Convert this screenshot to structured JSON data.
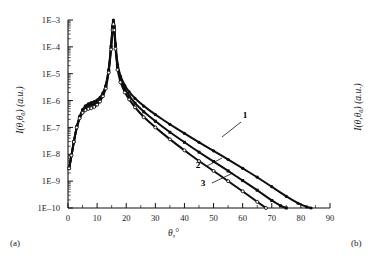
{
  "figure": {
    "panel_a_tag": "(a)",
    "panel_b_tag": "(b)"
  },
  "chart_data": {
    "type": "line",
    "title": "",
    "xlabel": "θ,°",
    "ylabel": "I(θ,θ₀) (a.u.)",
    "xlabel_italic": "θ",
    "xlabel_rest": ",°",
    "yscale": "log",
    "xscale": "linear",
    "xlim": [
      0,
      90
    ],
    "ylim": [
      1e-10,
      0.001
    ],
    "grid": false,
    "legend_position": "inline-annotations",
    "xticks": [
      0,
      10,
      20,
      30,
      40,
      50,
      60,
      70,
      80,
      90
    ],
    "xticklabels": [
      "0",
      "10",
      "20",
      "30",
      "40",
      "50",
      "60",
      "70",
      "80",
      "90"
    ],
    "yticks": [
      0.001,
      0.0001,
      1e-05,
      1e-06,
      1e-07,
      1e-08,
      1e-09,
      1e-10
    ],
    "yticklabels": [
      "1E–3",
      "1E–4",
      "1E–5",
      "1E–6",
      "1E–7",
      "1E–8",
      "1E–9",
      "1E–10"
    ],
    "annotations": [
      {
        "text": "1",
        "x": 46.0,
        "y": 4e-07
      },
      {
        "text": "2",
        "x": 41.0,
        "y": 2.2e-08
      },
      {
        "text": "3",
        "x": 44.5,
        "y": 6.5e-09
      }
    ],
    "series": [
      {
        "name": "1",
        "marker": "filled-circle",
        "x": [
          0.4,
          1.2,
          2.0,
          3.0,
          4.0,
          5.0,
          6.0,
          7.0,
          8.0,
          9.0,
          10.0,
          11.0,
          12.0,
          13.0,
          14.0,
          14.8,
          15.3,
          15.6,
          15.9,
          16.3,
          17.0,
          18.0,
          19.5,
          21.0,
          23.0,
          26.0,
          30.0,
          35.0,
          40.0,
          45.0,
          50.0,
          55.0,
          60.0,
          65.0,
          70.0,
          75.0,
          79.0,
          82.0,
          83.5
        ],
        "y": [
          3e-09,
          9e-09,
          3e-08,
          1.1e-07,
          2.6e-07,
          4.6e-07,
          6.4e-07,
          7.6e-07,
          8.4e-07,
          9.2e-07,
          1.05e-06,
          1.3e-06,
          1.9e-06,
          3.6e-06,
          1.4e-05,
          0.00011,
          0.0006,
          0.001,
          0.0006,
          0.00013,
          2.2e-05,
          8e-06,
          3.6e-06,
          2.1e-06,
          1.2e-06,
          6.2e-07,
          3e-07,
          1.3e-07,
          6e-08,
          2.8e-08,
          1.35e-08,
          6.4e-09,
          3e-09,
          1.4e-09,
          6.2e-10,
          2.7e-10,
          1.5e-10,
          1.1e-10,
          1e-10
        ]
      },
      {
        "name": "2",
        "marker": "filled-square",
        "x": [
          0.4,
          1.2,
          2.0,
          3.0,
          4.0,
          5.0,
          6.0,
          7.0,
          8.0,
          9.0,
          10.0,
          11.0,
          12.0,
          13.0,
          14.0,
          14.8,
          15.3,
          15.6,
          15.9,
          16.3,
          17.0,
          18.0,
          19.5,
          21.0,
          23.0,
          26.0,
          30.0,
          35.0,
          40.0,
          45.0,
          50.0,
          55.0,
          60.0,
          65.0,
          70.0,
          73.0,
          75.0
        ],
        "y": [
          3e-09,
          9e-09,
          3e-08,
          1.05e-07,
          2.4e-07,
          4.2e-07,
          5.6e-07,
          6.4e-07,
          6.8e-07,
          7.4e-07,
          8.6e-07,
          1.1e-06,
          1.7e-06,
          3.2e-06,
          1.25e-05,
          9.5e-05,
          0.0005,
          0.00085,
          0.0005,
          0.000105,
          1.75e-05,
          6.2e-06,
          2.7e-06,
          1.5e-06,
          8e-07,
          3.8e-07,
          1.7e-07,
          6.6e-08,
          2.8e-08,
          1.2e-08,
          5.4e-09,
          2.4e-09,
          1.05e-09,
          4.6e-10,
          1.9e-10,
          1.2e-10,
          1e-10
        ]
      },
      {
        "name": "3",
        "marker": "open-circle",
        "x": [
          0.4,
          1.2,
          2.0,
          3.0,
          4.0,
          5.0,
          6.0,
          7.0,
          8.0,
          9.0,
          10.0,
          11.0,
          12.0,
          13.0,
          14.0,
          14.8,
          15.3,
          15.6,
          15.9,
          16.3,
          17.0,
          18.0,
          19.5,
          21.0,
          23.0,
          26.0,
          30.0,
          35.0,
          40.0,
          45.0,
          50.0,
          55.0,
          60.0,
          65.0,
          68.0
        ],
        "y": [
          3e-09,
          9e-09,
          2.9e-08,
          1e-07,
          2.2e-07,
          3.5e-07,
          4.4e-07,
          4.9e-07,
          5.2e-07,
          5.8e-07,
          7e-07,
          9.2e-07,
          1.45e-06,
          2.8e-06,
          1.1e-05,
          8e-05,
          0.00042,
          0.0007,
          0.00042,
          8.5e-05,
          1.4e-05,
          4.8e-06,
          2e-06,
          1.1e-06,
          5.6e-07,
          2.4e-07,
          1e-07,
          3.6e-08,
          1.4e-08,
          5.6e-09,
          2.4e-09,
          1e-09,
          4.2e-10,
          1.7e-10,
          1e-10
        ]
      }
    ]
  },
  "panel_b": {
    "ylabel": "I(θ,θ₀) (a.u.)"
  }
}
